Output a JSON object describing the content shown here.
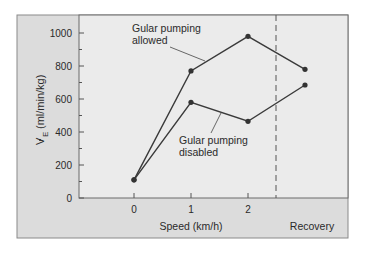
{
  "chart_data": {
    "type": "line",
    "title": "",
    "xlabel": "Speed (km/h)",
    "ylabel": "V̇E (ml/min/kg)",
    "ylabel_main": "V",
    "ylabel_sub": "E",
    "ylabel_units": "(ml/min/kg)",
    "ylim": [
      0,
      1000
    ],
    "yticks": [
      0,
      200,
      400,
      600,
      800,
      1000
    ],
    "categories": [
      "0",
      "1",
      "2",
      "Recovery"
    ],
    "xtick_labels": [
      "0",
      "1",
      "2"
    ],
    "recovery_label": "Recovery",
    "series": [
      {
        "name": "Gular pumping allowed",
        "label_line1": "Gular pumping",
        "label_line2": "allowed",
        "values": [
          110,
          770,
          980,
          780
        ]
      },
      {
        "name": "Gular pumping disabled",
        "label_line1": "Gular pumping",
        "label_line2": "disabled",
        "values": [
          110,
          580,
          465,
          685
        ]
      }
    ],
    "grid": false,
    "legend_position": "inline annotations",
    "annotations": [
      "dashed vertical line separating exercise speeds from Recovery"
    ]
  },
  "colors": {
    "outer_panel": "#dcdcdc",
    "plot_area": "#ebebeb",
    "line": "#3a3a3a",
    "marker": "#333333"
  }
}
